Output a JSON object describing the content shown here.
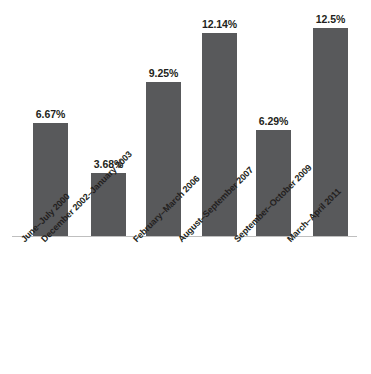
{
  "chart_data": {
    "type": "bar",
    "title": "",
    "subtitle": "",
    "xlabel": "",
    "ylabel": "",
    "ylim": [
      0,
      14
    ],
    "grid": false,
    "legend": false,
    "legend_position": "none",
    "axis_line_color": "#BFBFBF",
    "bar_color": "#58595B",
    "label_color": "#231F20",
    "value_suffix": "%",
    "categories": [
      "June–July 2000",
      "December 2002–January 2003",
      "February–March 2006",
      "August–September 2007",
      "September–October 2009",
      "March–April 2011"
    ],
    "values": [
      6.67,
      3.68,
      9.25,
      12.14,
      6.29,
      12.5
    ],
    "value_labels": [
      "6.67%",
      "3.68%",
      "9.25%",
      "12.14%",
      "6.29%",
      "12.5%"
    ],
    "bars": [
      {
        "category": "June–July 2000",
        "value": 6.67,
        "value_label": "6.67%",
        "left_px": 33,
        "width_px": 35,
        "height_px": 113
      },
      {
        "category": "December 2002–January 2003",
        "value": 3.68,
        "value_label": "3.68%",
        "left_px": 91,
        "width_px": 35,
        "height_px": 63
      },
      {
        "category": "February–March 2006",
        "value": 9.25,
        "value_label": "9.25%",
        "left_px": 146,
        "width_px": 35,
        "height_px": 154
      },
      {
        "category": "August–September 2007",
        "value": 12.14,
        "value_label": "12.14%",
        "left_px": 202,
        "width_px": 35,
        "height_px": 203
      },
      {
        "category": "September–October 2009",
        "value": 6.29,
        "value_label": "6.29%",
        "left_px": 256,
        "width_px": 35,
        "height_px": 106
      },
      {
        "category": "March–April 2011",
        "value": 12.5,
        "value_label": "12.5%",
        "left_px": 313,
        "width_px": 35,
        "height_px": 208
      }
    ],
    "category_label_anchors": [
      {
        "left_px": 19,
        "label": "June–July 2000"
      },
      {
        "left_px": 39,
        "label": "December 2002–January 2003"
      },
      {
        "left_px": 131,
        "label": "February–March 2006"
      },
      {
        "left_px": 176,
        "label": "August–September 2007"
      },
      {
        "left_px": 232,
        "label": "September–October 2009"
      },
      {
        "left_px": 285,
        "label": "March–April 2011"
      }
    ]
  }
}
